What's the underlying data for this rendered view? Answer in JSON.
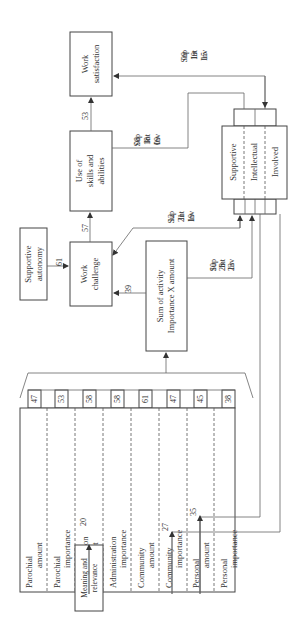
{
  "nodes": {
    "work_satisfaction": {
      "line1": "Work",
      "line2": "satisfaction"
    },
    "use_of_skills": {
      "line1": "Use of",
      "line2": "skills  and",
      "line3": "abilities"
    },
    "work_challenge": {
      "line1": "Work",
      "line2": "challenge"
    },
    "supportive_autonomy": {
      "line1": "Supportive",
      "line2": "autonomy"
    },
    "sum_of_activity": {
      "line1": "Sum of activity",
      "line2": "Importance X amount"
    },
    "meaning_relevance": {
      "line1": "Meaning and",
      "line2": "relevance"
    },
    "climate": {
      "segments": [
        "Supportive",
        "Intellectual",
        "Involved"
      ]
    }
  },
  "activities": [
    {
      "line1": "Parochial",
      "line2": "amount",
      "value": "47"
    },
    {
      "line1": "Parochial",
      "line2": "importance",
      "value": "53"
    },
    {
      "line1": "Administration",
      "line2": "amount",
      "value": "58"
    },
    {
      "line1": "Administration",
      "line2": "importance",
      "value": "58"
    },
    {
      "line1": "Community",
      "line2": "amount",
      "value": "61"
    },
    {
      "line1": "Community",
      "line2": "importance",
      "value": "47"
    },
    {
      "line1": "Personal",
      "line2": "amount",
      "value": "45"
    },
    {
      "line1": "Personal",
      "line2": "importance",
      "value": "38"
    }
  ],
  "edges": {
    "skills_to_satisfaction": "53",
    "challenge_to_skills": "57",
    "autonomy_to_challenge": "61",
    "sum_to_challenge": "39",
    "meaning_to_admin": "20",
    "climate_to_community_importance": "27",
    "climate_to_personal_amount": "35"
  },
  "coefficients": {
    "satisfaction": [
      {
        "v": "09",
        "k": "Sup"
      },
      {
        "v": "19",
        "k": "Int"
      },
      {
        "v": "15",
        "k": "Inv"
      }
    ],
    "skills": [
      {
        "v": "08",
        "k": "Sup"
      },
      {
        "v": "18",
        "k": "Int"
      },
      {
        "v": "09",
        "k": "Inv"
      }
    ],
    "challenge": [
      {
        "v": "12",
        "k": "Sup"
      },
      {
        "v": "21",
        "k": "Int"
      },
      {
        "v": "19",
        "k": "Inv"
      }
    ],
    "sum": [
      {
        "v": "10",
        "k": "Sup"
      },
      {
        "v": "28",
        "k": "Int"
      },
      {
        "v": "23",
        "k": "Inv"
      }
    ]
  }
}
